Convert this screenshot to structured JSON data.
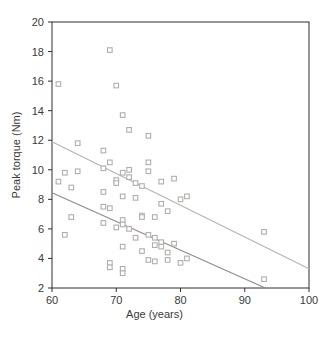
{
  "figure": {
    "background": "#ffffff",
    "axis_color": "#2f2f2f",
    "tick_label_color": "#3a3a3a"
  },
  "chart_data": {
    "type": "scatter",
    "title": "",
    "xlabel": "Age (years)",
    "ylabel": "Peak torque (Nm)",
    "xlim": [
      60,
      100
    ],
    "ylim": [
      2,
      20
    ],
    "xticks": [
      60,
      70,
      80,
      90,
      100
    ],
    "yticks": [
      2,
      4,
      6,
      8,
      10,
      12,
      14,
      16,
      18,
      20
    ],
    "grid": false,
    "legend": "none",
    "marker": "open-square",
    "marker_color": "#b2aeaa",
    "series": [
      {
        "name": "subjects",
        "points": [
          [
            61,
            15.8
          ],
          [
            69,
            18.1
          ],
          [
            70,
            15.7
          ],
          [
            71,
            13.7
          ],
          [
            72,
            12.7
          ],
          [
            75,
            12.3
          ],
          [
            64,
            11.8
          ],
          [
            68,
            11.3
          ],
          [
            69,
            10.5
          ],
          [
            75,
            10.5
          ],
          [
            68,
            10.1
          ],
          [
            72,
            10.0
          ],
          [
            62,
            9.8
          ],
          [
            64,
            9.9
          ],
          [
            71,
            9.8
          ],
          [
            75,
            9.9
          ],
          [
            61,
            9.2
          ],
          [
            70,
            9.3
          ],
          [
            70,
            9.1
          ],
          [
            72,
            9.5
          ],
          [
            73,
            9.1
          ],
          [
            74,
            8.9
          ],
          [
            77,
            9.2
          ],
          [
            79,
            9.4
          ],
          [
            63,
            8.8
          ],
          [
            68,
            8.5
          ],
          [
            71,
            8.2
          ],
          [
            73,
            8.1
          ],
          [
            77,
            7.7
          ],
          [
            78,
            7.2
          ],
          [
            80,
            8.0
          ],
          [
            81,
            8.2
          ],
          [
            68,
            7.5
          ],
          [
            69,
            7.4
          ],
          [
            63,
            6.8
          ],
          [
            68,
            6.4
          ],
          [
            70,
            6.1
          ],
          [
            71,
            6.6
          ],
          [
            71,
            6.3
          ],
          [
            72,
            6.0
          ],
          [
            74,
            6.9
          ],
          [
            74,
            6.8
          ],
          [
            76,
            6.8
          ],
          [
            62,
            5.6
          ],
          [
            75,
            5.6
          ],
          [
            73,
            5.4
          ],
          [
            76,
            5.4
          ],
          [
            77,
            5.1
          ],
          [
            79,
            5.0
          ],
          [
            71,
            4.8
          ],
          [
            74,
            4.5
          ],
          [
            76,
            4.9
          ],
          [
            77,
            4.8
          ],
          [
            78,
            4.4
          ],
          [
            69,
            3.7
          ],
          [
            69,
            3.4
          ],
          [
            71,
            3.3
          ],
          [
            71,
            3.0
          ],
          [
            75,
            3.9
          ],
          [
            76,
            3.8
          ],
          [
            78,
            3.9
          ],
          [
            80,
            3.7
          ],
          [
            81,
            4.0
          ],
          [
            93,
            5.8
          ],
          [
            93,
            2.6
          ]
        ]
      }
    ],
    "lines": [
      {
        "name": "upper-regression-line",
        "color": "#b8b4af",
        "x": [
          60,
          100
        ],
        "y": [
          11.9,
          3.3
        ]
      },
      {
        "name": "lower-regression-line",
        "color": "#8f8d8a",
        "x": [
          60,
          93.2
        ],
        "y": [
          8.45,
          2.0
        ]
      }
    ]
  }
}
